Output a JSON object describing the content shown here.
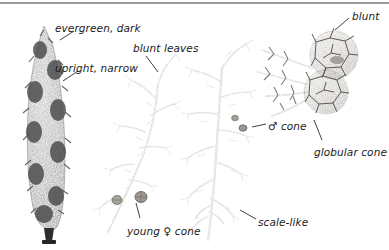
{
  "figure": {
    "background_color": "#ffffff",
    "top_rule_color": "#9a9a9a"
  },
  "labels": [
    {
      "id": "evergreen-dark",
      "text": "evergreen, dark",
      "x": 55,
      "y": 22
    },
    {
      "id": "upright-narrow",
      "text": "upright, narrow",
      "x": 55,
      "y": 62
    },
    {
      "id": "blunt-leaves",
      "text": "blunt leaves",
      "x": 133,
      "y": 42
    },
    {
      "id": "blunt",
      "text": "blunt",
      "x": 352,
      "y": 10
    },
    {
      "id": "male-cone",
      "text": "♂ cone",
      "x": 268,
      "y": 120
    },
    {
      "id": "globular-cone",
      "text": "globular cone",
      "x": 314,
      "y": 146
    },
    {
      "id": "young-female-cone",
      "text": "young ♀ cone",
      "x": 127,
      "y": 225
    },
    {
      "id": "scale-like",
      "text": "scale-like",
      "x": 258,
      "y": 216
    }
  ],
  "specimens": [
    {
      "id": "columnar-tree",
      "name": "columnar cypress tree silhouette"
    },
    {
      "id": "foliage-spray-left",
      "name": "foliage spray with young female cone"
    },
    {
      "id": "foliage-spray-right",
      "name": "foliage spray with male cones and scale-like leaves"
    },
    {
      "id": "cone-cluster",
      "name": "pair of mature globular cones on shoot"
    }
  ],
  "colors": {
    "ink_dark": "#2a2a2a",
    "foliage_mid": "#6f6f6f",
    "foliage_light": "#a8a8a8",
    "cone_fill": "#b0aca4",
    "cone_shadow": "#6a665f"
  }
}
